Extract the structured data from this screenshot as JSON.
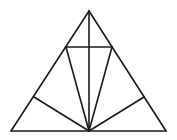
{
  "diagram": {
    "title": "",
    "stroke_color": "#1a1a1a",
    "background": "#ffffff",
    "points": {
      "apex": [
        89,
        11
      ],
      "base_left": [
        11,
        131
      ],
      "base_right": [
        166,
        131
      ],
      "base_mid": [
        89,
        131
      ],
      "upper_left": [
        66,
        47
      ],
      "upper_right": [
        112,
        47
      ],
      "lower_left": [
        34,
        97
      ],
      "lower_right": [
        144,
        97
      ]
    },
    "segments": [
      {
        "name": "side-left",
        "from": "apex",
        "to": "base_left"
      },
      {
        "name": "side-right",
        "from": "apex",
        "to": "base_right"
      },
      {
        "name": "base",
        "from": "base_left",
        "to": "base_right"
      },
      {
        "name": "altitude",
        "from": "apex",
        "to": "base_mid"
      },
      {
        "name": "horizontal-chord",
        "from": "upper_left",
        "to": "upper_right"
      },
      {
        "name": "cevian-upper-left",
        "from": "upper_left",
        "to": "base_mid"
      },
      {
        "name": "cevian-upper-right",
        "from": "upper_right",
        "to": "base_mid"
      },
      {
        "name": "cevian-lower-left",
        "from": "lower_left",
        "to": "base_mid"
      },
      {
        "name": "cevian-lower-right",
        "from": "lower_right",
        "to": "base_mid"
      }
    ]
  }
}
